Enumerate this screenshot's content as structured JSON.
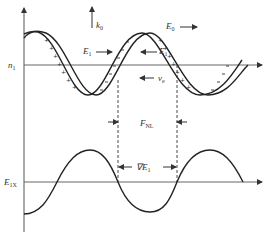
{
  "diagram": {
    "type": "physics-wave-diagram",
    "colors": {
      "line": "#222222",
      "axis": "#555555",
      "label": "#333333",
      "background": "#ffffff"
    },
    "upper_panel": {
      "axis_label": {
        "main": "n",
        "sub": "1"
      },
      "wave_vector": {
        "main": "k",
        "sub": "0"
      },
      "pump_field": {
        "main": "E",
        "sub": "0"
      },
      "field_left": {
        "main": "E",
        "sub": "1"
      },
      "field_right": {
        "main": "E",
        "sub": "1"
      },
      "velocity": {
        "main": "v",
        "sub": "e"
      },
      "band_signs": {
        "descending": "+",
        "ascending": "−"
      }
    },
    "middle": {
      "force": {
        "main": "F",
        "sub": "NL"
      },
      "gradient": {
        "main": "∇E",
        "sub": "1"
      }
    },
    "lower_panel": {
      "axis_label": {
        "main": "E",
        "sub": "1X"
      }
    }
  }
}
